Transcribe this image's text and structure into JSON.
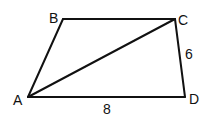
{
  "diagram": {
    "type": "quadrilateral",
    "colors": {
      "stroke": "#111111",
      "background": "#ffffff"
    },
    "vertices": {
      "A": {
        "label": "A"
      },
      "B": {
        "label": "B"
      },
      "C": {
        "label": "C"
      },
      "D": {
        "label": "D"
      }
    },
    "edges": [
      "AB",
      "BC",
      "CD",
      "DA",
      "AC"
    ],
    "measurements": {
      "CD": "6",
      "AD": "8"
    }
  }
}
